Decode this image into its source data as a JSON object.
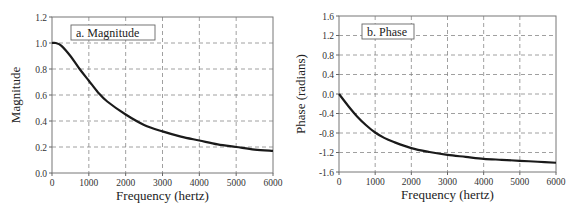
{
  "chart_data": [
    {
      "type": "line",
      "panel_label": "a.  Magnitude",
      "title": "a. Magnitude",
      "xlabel": "Frequency (hertz)",
      "ylabel": "Magnitude",
      "xlim": [
        0,
        6000
      ],
      "ylim": [
        0.0,
        1.2
      ],
      "x_ticks": [
        "0",
        "1000",
        "2000",
        "3000",
        "4000",
        "5000",
        "6000"
      ],
      "y_ticks": [
        "0.0",
        "0.2",
        "0.4",
        "0.6",
        "0.8",
        "1.0",
        "1.2"
      ],
      "grid": true,
      "x": [
        0,
        100,
        250,
        500,
        750,
        1000,
        1250,
        1500,
        2000,
        2500,
        3000,
        3500,
        4000,
        4500,
        5000,
        5500,
        6000
      ],
      "series": [
        {
          "name": "Magnitude",
          "values": [
            1.0,
            1.0,
            0.98,
            0.9,
            0.8,
            0.71,
            0.62,
            0.55,
            0.45,
            0.37,
            0.32,
            0.28,
            0.25,
            0.22,
            0.2,
            0.18,
            0.17
          ]
        }
      ]
    },
    {
      "type": "line",
      "panel_label": "b. Phase",
      "title": "b. Phase",
      "xlabel": "Frequency (hertz)",
      "ylabel": "Phase (radians)",
      "xlim": [
        0,
        6000
      ],
      "ylim": [
        -1.6,
        1.6
      ],
      "x_ticks": [
        "0",
        "1000",
        "2000",
        "3000",
        "4000",
        "5000",
        "6000"
      ],
      "y_ticks": [
        "-1.6",
        "-1.2",
        "-0.8",
        "-0.4",
        "0.0",
        "0.4",
        "0.8",
        "1.2",
        "1.6"
      ],
      "grid": true,
      "x": [
        0,
        250,
        500,
        750,
        1000,
        1250,
        1500,
        2000,
        2500,
        3000,
        3500,
        4000,
        4500,
        5000,
        5500,
        6000
      ],
      "series": [
        {
          "name": "Phase",
          "values": [
            0.0,
            -0.24,
            -0.46,
            -0.64,
            -0.79,
            -0.9,
            -0.98,
            -1.11,
            -1.19,
            -1.25,
            -1.29,
            -1.33,
            -1.35,
            -1.37,
            -1.39,
            -1.41
          ]
        }
      ]
    }
  ]
}
